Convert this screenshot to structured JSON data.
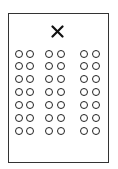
{
  "diagram": {
    "type": "seating-layout",
    "frame": {
      "border_color": "#333333",
      "background": "#ffffff"
    },
    "marker": {
      "icon": "x-mark-icon",
      "glyph": "✕",
      "color": "#111111"
    },
    "seats": {
      "rows": 7,
      "groups": 3,
      "columns_per_group": 2,
      "total": 42,
      "column_x": [
        19,
        30,
        49,
        61,
        84,
        96
      ],
      "row_y": [
        54,
        66,
        79,
        92,
        105,
        118,
        131
      ],
      "stroke_color": "#222222"
    }
  }
}
